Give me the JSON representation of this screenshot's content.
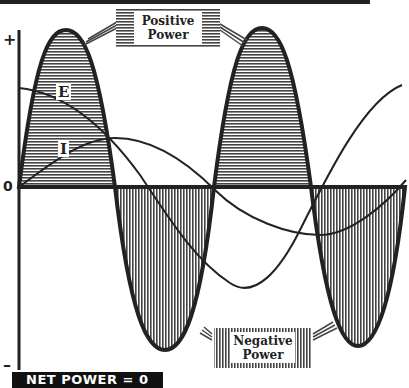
{
  "diagram": {
    "axis": {
      "plus_label": "+",
      "zero_label": "0",
      "minus_label": "–"
    },
    "curves": {
      "voltage_label": "E",
      "current_label": "I"
    },
    "callouts": {
      "positive": {
        "line1": "Positive",
        "line2": "Power"
      },
      "negative": {
        "line1": "Negative",
        "line2": "Power"
      }
    },
    "footer": {
      "net_power": "NET POWER = 0"
    },
    "colors": {
      "ink": "#222222",
      "background": "#ffffff",
      "hatch": "#555555"
    }
  }
}
